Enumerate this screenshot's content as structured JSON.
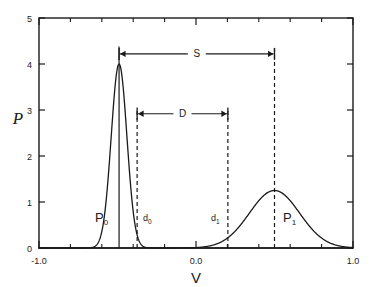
{
  "chart_data": {
    "type": "line",
    "title": "",
    "xlabel": "V",
    "ylabel": "P",
    "xlim": [
      -1.0,
      1.0
    ],
    "ylim": [
      0,
      5
    ],
    "grid": false,
    "legend": null,
    "x_ticks_major": [
      -1.0,
      0.0,
      1.0
    ],
    "x_tick_labels": [
      "-1.0",
      "0.0",
      "1.0"
    ],
    "x_ticks_minor": [
      -0.8,
      -0.6,
      -0.4,
      -0.2,
      0.2,
      0.4,
      0.6,
      0.8
    ],
    "y_ticks": [
      0,
      1,
      2,
      3,
      4,
      5
    ],
    "y_tick_labels": [
      "0",
      "1",
      "2",
      "3",
      "4",
      "5"
    ],
    "series": [
      {
        "name": "P0",
        "label": "P",
        "subscript": "0",
        "shape": "gaussian",
        "mean": -0.49,
        "sigma": 0.05,
        "peak": 4.0,
        "color": "#1a1a1a"
      },
      {
        "name": "P1",
        "label": "P",
        "subscript": "1",
        "shape": "gaussian",
        "mean": 0.5,
        "sigma": 0.16,
        "peak": 1.25,
        "color": "#1a1a1a"
      }
    ],
    "markers": [
      {
        "name": "d0",
        "label": "d",
        "subscript": "0",
        "x": -0.375,
        "style": "dashed",
        "y_top": 3.05
      },
      {
        "name": "d1",
        "label": "d",
        "subscript": "1",
        "x": 0.203,
        "style": "dashed",
        "y_top": 3.05
      },
      {
        "name": "p0_peak",
        "label": "",
        "subscript": "",
        "x": -0.49,
        "style": "solid",
        "y_top": 4.38
      },
      {
        "name": "p1_peak",
        "label": "",
        "subscript": "",
        "x": 0.5,
        "style": "dashed",
        "y_top": 4.38
      }
    ],
    "annotations": [
      {
        "name": "S",
        "label": "S",
        "type": "double-arrow",
        "x_from": -0.49,
        "x_to": 0.5,
        "y": 4.22
      },
      {
        "name": "D",
        "label": "D",
        "type": "double-arrow",
        "x_from": -0.375,
        "x_to": 0.203,
        "y": 2.92
      }
    ]
  },
  "axes": {
    "x_axis_label": "V",
    "y_axis_label": "P"
  }
}
